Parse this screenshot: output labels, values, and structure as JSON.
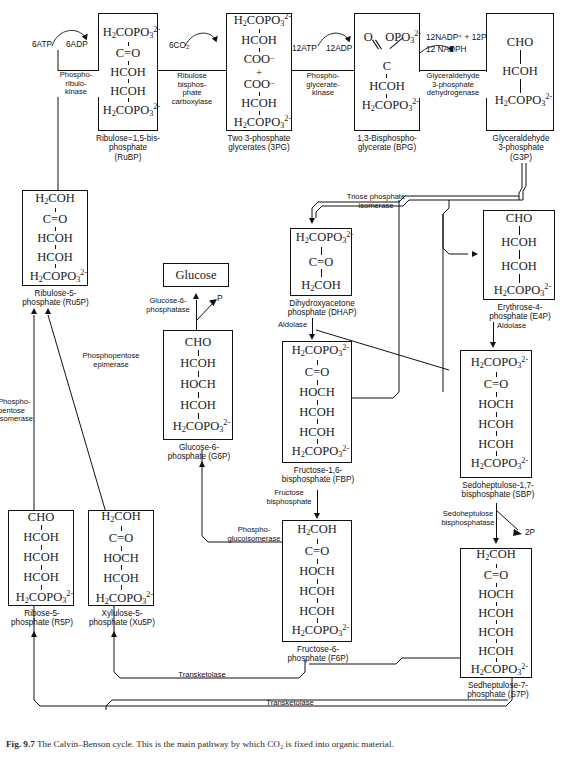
{
  "figure": {
    "number": "Fig. 9.7",
    "caption": "The Calvin–Benson cycle. This is the main pathway by which CO₂ is fixed into organic material."
  },
  "boxes": {
    "rubp": {
      "name": "Ribulose-1,5-bisphosphate",
      "caption": "Ribulose=1,5-bis-\nphosphate\n(RuBP)"
    },
    "pg3": {
      "name": "Two 3-phosphate glycerates",
      "caption": "Two 3-phosphate\nglycerates (3PG)"
    },
    "bpg": {
      "name": "1,3-Bisphosphoglycerate",
      "caption": "1,3-Bisphospho-\nglycerate (BPG)"
    },
    "g3p": {
      "name": "Glyceraldehyde 3-phosphate",
      "caption": "Glyceraldehyde\n3-phosphate\n(G3P)"
    },
    "ru5p": {
      "name": "Ribulose-5-phosphate",
      "caption": "Ribulose-5-\nphosphate (Ru5P)"
    },
    "glucose": {
      "name": "Glucose",
      "label": "Glucose",
      "caption": ""
    },
    "dhap": {
      "name": "Dihydroxyacetone phosphate",
      "caption": "Dihydroxyacetone\nphosphate (DHAP)"
    },
    "e4p": {
      "name": "Erythrose-4-phosphate",
      "caption": "Erythrose-4-\nphosphate (E4P)"
    },
    "g6p": {
      "name": "Glucose-6-phosphate",
      "caption": "Glucose-6-\nphosphate (G6P)"
    },
    "fbp": {
      "name": "Fructose-1,6-bisphosphate",
      "caption": "Fructose-1,6-\nbisphosphate (FBP)"
    },
    "sbp": {
      "name": "Sedoheptulose-1,7-bisphosphate",
      "caption": "Sedoheptulose-1,7-\nbisphosphate (SBP)"
    },
    "r5p": {
      "name": "Ribose-5-phosphate",
      "caption": "Ribose-5-\nphosphate (R5P)"
    },
    "xu5p": {
      "name": "Xylulose-5-phosphate",
      "caption": "Xylulose-5-\nphosphate (Xu5P)"
    },
    "f6p": {
      "name": "Fructose-6-phosphate",
      "caption": "Fructose-6-\nphosphate (F6P)"
    },
    "s7p": {
      "name": "Sedheptulose-7-phosphate",
      "caption": "Sedheptulose-7-\nphosphate (S7P)"
    }
  },
  "enzymes": {
    "phosphoribulokinase": "Phospho-\nribulo-\nkinase",
    "rubisco": "Ribulose\nbisphos-\nphate\ncarboxylase",
    "pgk": "Phospho-\nglycerate-\nkinase",
    "gapdh": "Glyceraldehyde\n3-phosphate\ndehydrogenase",
    "tpi": "Triose phosphate\nisomerase",
    "aldolase_1": "Aldolase",
    "aldolase_2": "Aldolase",
    "fbpase": "Fructose\nbisphosphate",
    "sbpase": "Sedoheptulose\nbisphosphatase",
    "g6pase": "Glucose-6-\nphosphatase",
    "pgi": "Phospho-\nglucoisomerase",
    "ppe": "Phosphopentose\nepimerase",
    "ppi": "Phospho-\npentose\nisomerase",
    "transketolase_1": "Transketolase",
    "transketolase_2": "Transketolase"
  },
  "cofactors": {
    "atp6": "6ATP",
    "adp6": "6ADP",
    "co2_6": "6CO₂",
    "atp12": "12ATP",
    "adp12": "12ADP",
    "nadp12": "12NADP⁺ + 12P",
    "nadph12": "12 NADPH",
    "p_glucose": "P",
    "p2_sbp": "2P"
  },
  "colors": {
    "line": "#111111",
    "text": "#1a1a1a",
    "background": "#ffffff"
  }
}
